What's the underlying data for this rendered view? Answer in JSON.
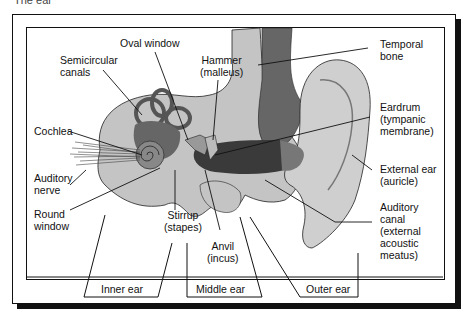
{
  "caption": "The ear",
  "diagram": {
    "labels": {
      "oval_window": [
        "Oval window"
      ],
      "semicircular_canals": [
        "Semicircular",
        "canals"
      ],
      "hammer": [
        "Hammer",
        "(malleus)"
      ],
      "temporal_bone": [
        "Temporal",
        "bone"
      ],
      "cochlea": [
        "Cochlea"
      ],
      "eardrum": [
        "Eardrum",
        "(tympanic",
        "membrane)"
      ],
      "auditory_nerve": [
        "Auditory",
        "nerve"
      ],
      "external_ear": [
        "External ear",
        "(auricle)"
      ],
      "round_window": [
        "Round",
        "window"
      ],
      "stirrup": [
        "Stirrup",
        "(stapes)"
      ],
      "auditory_canal": [
        "Auditory",
        "canal",
        "(external",
        "acoustic",
        "meatus)"
      ],
      "anvil": [
        "Anvil",
        "(incus)"
      ]
    },
    "sections": {
      "inner_ear": "Inner ear",
      "middle_ear": "Middle ear",
      "outer_ear": "Outer ear"
    },
    "colors": {
      "line": "#111111",
      "bone_fill": "#c4c4c4",
      "dark_tissue": "#555555",
      "mid_tissue": "#888888",
      "background": "#ffffff"
    }
  }
}
